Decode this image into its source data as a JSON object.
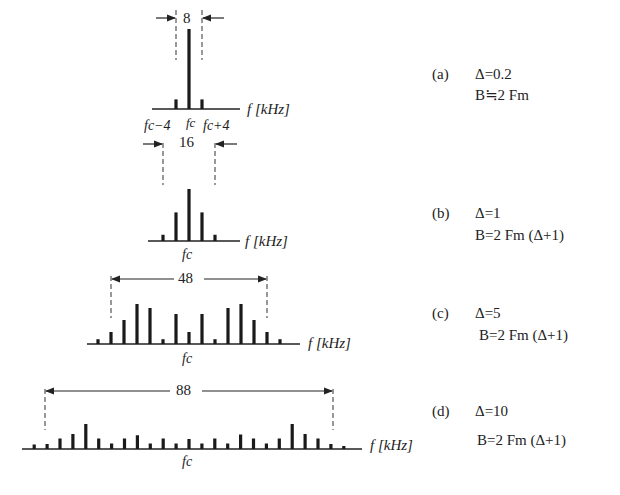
{
  "axis_label": "f [kHz]",
  "center_label": "fc",
  "panels": [
    {
      "id": "a",
      "tag": "(a)",
      "delta_label": "Δ=0.2",
      "bandwidth_formula": "B≒2 Fm",
      "bandwidth_value": "8",
      "side_labels": {
        "left": "fc−4",
        "center": "fc",
        "right": "fc+4"
      },
      "spectral_lines": [
        0.12,
        1.0,
        0.12
      ]
    },
    {
      "id": "b",
      "tag": "(b)",
      "delta_label": "Δ=1",
      "bandwidth_formula": "B=2 Fm (Δ+1)",
      "bandwidth_value": "16",
      "spectral_lines": [
        0.12,
        0.55,
        1.0,
        0.55,
        0.12
      ]
    },
    {
      "id": "c",
      "tag": "(c)",
      "delta_label": "Δ=5",
      "bandwidth_formula": "B=2 Fm (Δ+1)",
      "bandwidth_value": "48",
      "spectral_lines": [
        0.12,
        0.3,
        0.6,
        1.0,
        0.9,
        0.12,
        0.75,
        0.3,
        0.75,
        0.12,
        0.9,
        1.0,
        0.6,
        0.3,
        0.12
      ]
    },
    {
      "id": "d",
      "tag": "(d)",
      "delta_label": "Δ=10",
      "bandwidth_formula": "B=2 Fm (Δ+1)",
      "bandwidth_value": "88",
      "spectral_lines": [
        0.18,
        0.2,
        0.42,
        0.6,
        1.0,
        0.42,
        0.22,
        0.42,
        0.55,
        0.22,
        0.42,
        0.22,
        0.4,
        0.22,
        0.42,
        0.22,
        0.58,
        0.42,
        0.22,
        0.42,
        1.0,
        0.6,
        0.42,
        0.2,
        0.1
      ]
    }
  ],
  "chart_data": [
    {
      "type": "bar",
      "title": "(a) Δ=0.2, B≒2Fm",
      "xlabel": "f [kHz]",
      "categories": [
        "fc−4",
        "fc",
        "fc+4"
      ],
      "values": [
        0.12,
        1.0,
        0.12
      ],
      "annotation": "bandwidth 8"
    },
    {
      "type": "bar",
      "title": "(b) Δ=1, B=2Fm(Δ+1)",
      "xlabel": "f [kHz]",
      "categories": [
        "fc−8",
        "fc−4",
        "fc",
        "fc+4",
        "fc+8"
      ],
      "values": [
        0.12,
        0.55,
        1.0,
        0.55,
        0.12
      ],
      "annotation": "bandwidth 16"
    },
    {
      "type": "bar",
      "title": "(c) Δ=5, B=2Fm(Δ+1)",
      "xlabel": "f [kHz]",
      "categories": [
        "-7",
        "-6",
        "-5",
        "-4",
        "-3",
        "-2",
        "-1",
        "fc",
        "1",
        "2",
        "3",
        "4",
        "5",
        "6",
        "7"
      ],
      "values": [
        0.12,
        0.3,
        0.6,
        1.0,
        0.9,
        0.12,
        0.75,
        0.3,
        0.75,
        0.12,
        0.9,
        1.0,
        0.6,
        0.3,
        0.12
      ],
      "annotation": "bandwidth 48"
    },
    {
      "type": "bar",
      "title": "(d) Δ=10, B=2Fm(Δ+1)",
      "xlabel": "f [kHz]",
      "categories": [
        "-12",
        "-11",
        "-10",
        "-9",
        "-8",
        "-7",
        "-6",
        "-5",
        "-4",
        "-3",
        "-2",
        "-1",
        "fc",
        "1",
        "2",
        "3",
        "4",
        "5",
        "6",
        "7",
        "8",
        "9",
        "10",
        "11",
        "12"
      ],
      "values": [
        0.18,
        0.2,
        0.42,
        0.6,
        1.0,
        0.42,
        0.22,
        0.42,
        0.55,
        0.22,
        0.42,
        0.22,
        0.4,
        0.22,
        0.42,
        0.22,
        0.58,
        0.42,
        0.22,
        0.42,
        1.0,
        0.6,
        0.42,
        0.2,
        0.1
      ],
      "annotation": "bandwidth 88"
    }
  ]
}
